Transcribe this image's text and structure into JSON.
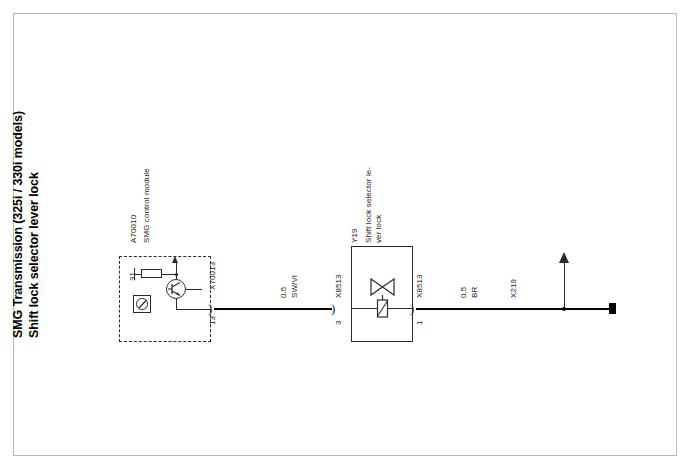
{
  "document": {
    "title_line_1": "SMG Transmission (325i / 330i models)",
    "title_line_2": "Shift lock selector lever lock"
  },
  "ecu": {
    "id": "A70010",
    "name": "SMG  control module",
    "internal_terminal": "31",
    "connector": "X70013",
    "pin": "13",
    "symbols": {
      "resistor": "resistor-symbol",
      "transistor": "transistor-symbol",
      "supply_arrow": "up-arrow-icon",
      "component": "component-symbol"
    }
  },
  "wires": [
    {
      "id": "wire-signal",
      "cross_section": "0.5",
      "color_code": "SW/VI"
    },
    {
      "id": "wire-ground",
      "cross_section": "0.5",
      "color_code": "BR"
    }
  ],
  "connectors": [
    {
      "id": "connector-x8513-in",
      "name": "X8513",
      "pin": "3"
    },
    {
      "id": "connector-x8513-out",
      "name": "X8513",
      "pin": "1"
    }
  ],
  "device": {
    "id": "Y19",
    "name_line_1": "Shift lock selector le-",
    "name_line_2": "ver lock",
    "symbol": "solenoid-valve-symbol"
  },
  "ground_point": {
    "name": "X219",
    "symbol": "up-arrow-icon"
  },
  "colors": {
    "line": "#2b2b2b",
    "wire": "#000000",
    "frame": "#b9b9b9",
    "background": "#ffffff"
  }
}
